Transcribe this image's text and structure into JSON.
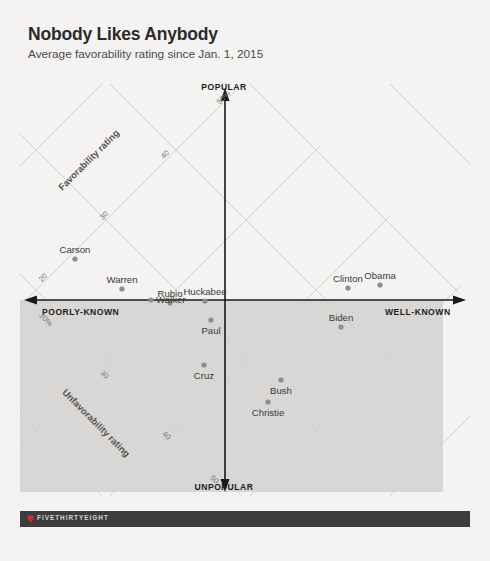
{
  "header": {
    "title": "Nobody Likes Anybody",
    "subtitle": "Average favorability rating since Jan. 1, 2015"
  },
  "footer": {
    "logo_text": "FIVETHIRTYEIGHT",
    "logo_icon": "fivethirtyeight-logo-icon"
  },
  "chart_data": {
    "type": "scatter",
    "title": "Nobody Likes Anybody",
    "subtitle": "Average favorability rating since Jan. 1, 2015",
    "xlabel": "Name recognition",
    "ylabel": "Net favorability",
    "grid": true,
    "legend": false,
    "axis_ends": {
      "top": "POPULAR",
      "bottom": "UNPOPULAR",
      "left": "POORLY-KNOWN",
      "right": "WELL-KNOWN"
    },
    "diagonal_axes": [
      {
        "name": "Favorability rating",
        "ticks": [
          "20",
          "30",
          "40",
          "50%"
        ]
      },
      {
        "name": "Unfavorability rating",
        "ticks": [
          "20%",
          "30",
          "40",
          "50"
        ]
      }
    ],
    "points": [
      {
        "label": "Carson",
        "x": 75,
        "y": 259
      },
      {
        "label": "Warren",
        "x": 122,
        "y": 289
      },
      {
        "label": "Walker",
        "x": 151,
        "y": 300
      },
      {
        "label": "Rubio",
        "x": 170,
        "y": 303
      },
      {
        "label": "Huckabee",
        "x": 205,
        "y": 301
      },
      {
        "label": "Paul",
        "x": 211,
        "y": 320
      },
      {
        "label": "Cruz",
        "x": 204,
        "y": 365
      },
      {
        "label": "Bush",
        "x": 281,
        "y": 380
      },
      {
        "label": "Christie",
        "x": 268,
        "y": 402
      },
      {
        "label": "Biden",
        "x": 341,
        "y": 327
      },
      {
        "label": "Clinton",
        "x": 348,
        "y": 288
      },
      {
        "label": "Obama",
        "x": 380,
        "y": 285
      }
    ]
  },
  "colors": {
    "background": "#f4f3f1",
    "shade": "#d8d7d5",
    "dot": "#8d8d8d",
    "axis": "#1a1a1a",
    "grid": "#cfcecb",
    "footer": "#3d3d3d"
  }
}
